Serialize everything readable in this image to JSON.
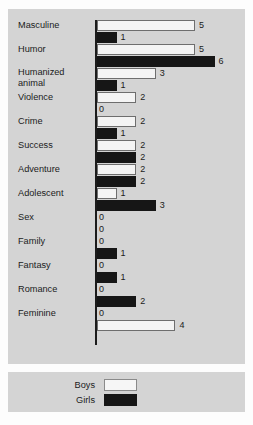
{
  "chart_data": {
    "type": "bar",
    "orientation": "horizontal",
    "title": "",
    "subtitle": "",
    "xlabel": "",
    "ylabel": "",
    "xlim": [
      0,
      6
    ],
    "grid": false,
    "legend_position": "bottom",
    "categories": [
      "Masculine",
      "Humor",
      "Humanized animal",
      "Violence",
      "Crime",
      "Success",
      "Adventure",
      "Adolescent",
      "Sex",
      "Family",
      "Fantasy",
      "Romance",
      "Feminine"
    ],
    "series": [
      {
        "name": "Boys",
        "color": "#f4f4f4",
        "values": [
          5,
          5,
          3,
          2,
          2,
          2,
          2,
          1,
          0,
          0,
          0,
          0,
          0
        ]
      },
      {
        "name": "Girls",
        "color": "#161616",
        "values": [
          1,
          6,
          1,
          0,
          1,
          2,
          2,
          3,
          0,
          1,
          1,
          2,
          4
        ]
      }
    ]
  },
  "chart": {
    "rows": [
      {
        "label": "Masculine",
        "label_lines": [
          "Masculine"
        ],
        "two_line": false,
        "boys": {
          "value": 5,
          "label": "5",
          "style": "boys"
        },
        "girls": {
          "value": 1,
          "label": "1",
          "style": "girls"
        }
      },
      {
        "label": "Humor",
        "label_lines": [
          "Humor"
        ],
        "two_line": false,
        "boys": {
          "value": 5,
          "label": "5",
          "style": "boys"
        },
        "girls": {
          "value": 6,
          "label": "6",
          "style": "girls"
        }
      },
      {
        "label": "Humanized animal",
        "label_lines": [
          "Humanized",
          "animal"
        ],
        "two_line": true,
        "boys": {
          "value": 3,
          "label": "3",
          "style": "boys"
        },
        "girls": {
          "value": 1,
          "label": "1",
          "style": "girls"
        }
      },
      {
        "label": "Violence",
        "label_lines": [
          "Violence"
        ],
        "two_line": false,
        "boys": {
          "value": 2,
          "label": "2",
          "style": "boys"
        },
        "girls": {
          "value": 0,
          "label": "0",
          "style": "girls"
        }
      },
      {
        "label": "Crime",
        "label_lines": [
          "Crime"
        ],
        "two_line": false,
        "boys": {
          "value": 2,
          "label": "2",
          "style": "boys"
        },
        "girls": {
          "value": 1,
          "label": "1",
          "style": "girls"
        }
      },
      {
        "label": "Success",
        "label_lines": [
          "Success"
        ],
        "two_line": false,
        "boys": {
          "value": 2,
          "label": "2",
          "style": "boys"
        },
        "girls": {
          "value": 2,
          "label": "2",
          "style": "girls"
        }
      },
      {
        "label": "Adventure",
        "label_lines": [
          "Adventure"
        ],
        "two_line": false,
        "boys": {
          "value": 2,
          "label": "2",
          "style": "boys"
        },
        "girls": {
          "value": 2,
          "label": "2",
          "style": "girls"
        }
      },
      {
        "label": "Adolescent",
        "label_lines": [
          "Adolescent"
        ],
        "two_line": false,
        "boys": {
          "value": 1,
          "label": "1",
          "style": "boys"
        },
        "girls": {
          "value": 3,
          "label": "3",
          "style": "girls"
        }
      },
      {
        "label": "Sex",
        "label_lines": [
          "Sex"
        ],
        "two_line": false,
        "boys": {
          "value": 0,
          "label": "0",
          "style": "boys"
        },
        "girls": {
          "value": 0,
          "label": "0",
          "style": "girls"
        }
      },
      {
        "label": "Family",
        "label_lines": [
          "Family"
        ],
        "two_line": false,
        "boys": {
          "value": 0,
          "label": "0",
          "style": "boys"
        },
        "girls": {
          "value": 1,
          "label": "1",
          "style": "girls"
        }
      },
      {
        "label": "Fantasy",
        "label_lines": [
          "Fantasy"
        ],
        "two_line": false,
        "boys": {
          "value": 0,
          "label": "0",
          "style": "boys"
        },
        "girls": {
          "value": 1,
          "label": "1",
          "style": "girls"
        }
      },
      {
        "label": "Romance",
        "label_lines": [
          "Romance"
        ],
        "two_line": false,
        "boys": {
          "value": 0,
          "label": "0",
          "style": "boys"
        },
        "girls": {
          "value": 2,
          "label": "2",
          "style": "girls"
        }
      },
      {
        "label": "Feminine",
        "label_lines": [
          "Feminine"
        ],
        "two_line": false,
        "boys": {
          "value": 0,
          "label": "0",
          "style": "boys"
        },
        "girls": {
          "value": 4,
          "label": "4",
          "style": "boys"
        }
      }
    ]
  },
  "legend": {
    "items": [
      {
        "label": "Boys",
        "swatch": "boys",
        "color": "#f4f4f4"
      },
      {
        "label": "Girls",
        "swatch": "girls",
        "color": "#161616"
      }
    ]
  },
  "colors": {
    "panel_background": "#d4d4d4",
    "page_background": "#fdfdfd",
    "boys_bar": "#f4f4f4",
    "girls_bar": "#161616",
    "axis": "#1b1b1b",
    "text": "#1b1b1b"
  },
  "scale": {
    "px_per_unit": 19.6,
    "max_value": 6
  }
}
